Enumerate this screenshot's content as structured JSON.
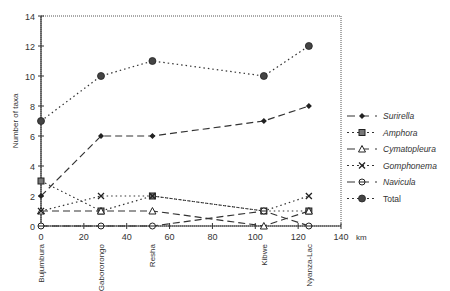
{
  "chart_data": {
    "type": "line",
    "title": "",
    "xlabel": "km",
    "ylabel": "Number of taxa",
    "xlim": [
      0,
      140
    ],
    "ylim": [
      0,
      14
    ],
    "xticks": [
      0,
      20,
      40,
      60,
      80,
      100,
      120,
      140
    ],
    "yticks": [
      0,
      2,
      4,
      6,
      8,
      10,
      12,
      14
    ],
    "sites": [
      {
        "name": "Bujumbura",
        "km": 0
      },
      {
        "name": "Gabororongo",
        "km": 28
      },
      {
        "name": "Resha",
        "km": 52
      },
      {
        "name": "Kibwe",
        "km": 104
      },
      {
        "name": "Nyanza-Lac",
        "km": 125
      }
    ],
    "x": [
      0,
      28,
      52,
      104,
      125
    ],
    "series": [
      {
        "name": "Surirella",
        "values": [
          2,
          6,
          6,
          7,
          8
        ],
        "marker": "diamond",
        "dash": "long"
      },
      {
        "name": "Amphora",
        "values": [
          3,
          1,
          2,
          1,
          1
        ],
        "marker": "square",
        "dash": "dot"
      },
      {
        "name": "Cymatopleura",
        "values": [
          1,
          1,
          1,
          0,
          1
        ],
        "marker": "triangle",
        "dash": "long"
      },
      {
        "name": "Gomphonema",
        "values": [
          1,
          2,
          2,
          1,
          2
        ],
        "marker": "x",
        "dash": "dot"
      },
      {
        "name": "Navicula",
        "values": [
          0,
          0,
          0,
          1,
          0
        ],
        "marker": "circle-open",
        "dash": "long"
      },
      {
        "name": "Total",
        "values": [
          7,
          10,
          11,
          10,
          12
        ],
        "marker": "circle",
        "dash": "dot"
      }
    ],
    "grid": false,
    "legend_position": "right"
  }
}
